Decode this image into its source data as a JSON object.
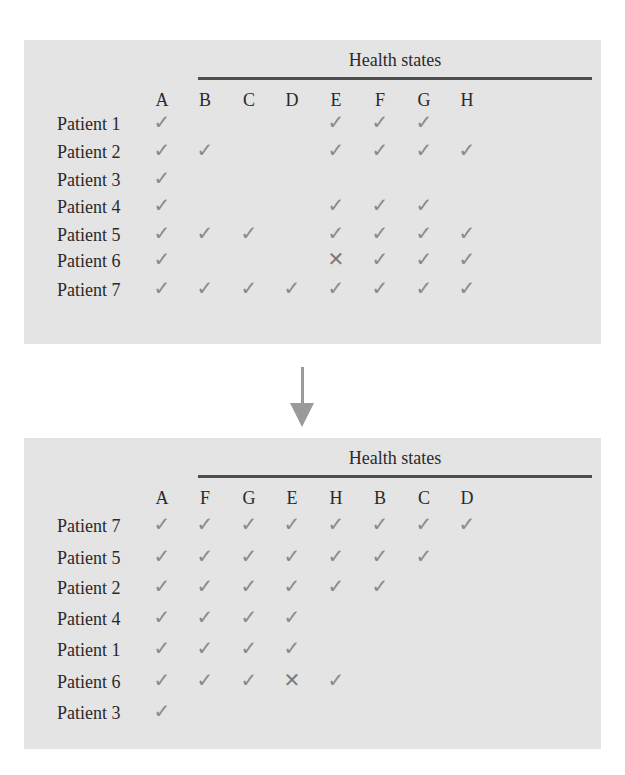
{
  "tables": [
    {
      "title": "Health states",
      "columns": [
        "A",
        "B",
        "C",
        "D",
        "E",
        "F",
        "G",
        "H"
      ],
      "rows": [
        {
          "label": "Patient 1",
          "cells": [
            "check",
            "",
            "",
            "",
            "check",
            "check",
            "check",
            ""
          ]
        },
        {
          "label": "Patient 2",
          "cells": [
            "check",
            "check",
            "",
            "",
            "check",
            "check",
            "check",
            "check"
          ]
        },
        {
          "label": "Patient 3",
          "cells": [
            "check",
            "",
            "",
            "",
            "",
            "",
            "",
            ""
          ]
        },
        {
          "label": "Patient 4",
          "cells": [
            "check",
            "",
            "",
            "",
            "check",
            "check",
            "check",
            ""
          ]
        },
        {
          "label": "Patient 5",
          "cells": [
            "check",
            "check",
            "check",
            "",
            "check",
            "check",
            "check",
            "check"
          ]
        },
        {
          "label": "Patient 6",
          "cells": [
            "check",
            "",
            "",
            "",
            "cross",
            "check",
            "check",
            "check"
          ]
        },
        {
          "label": "Patient 7",
          "cells": [
            "check",
            "check",
            "check",
            "check",
            "check",
            "check",
            "check",
            "check"
          ]
        }
      ]
    },
    {
      "title": "Health states",
      "columns": [
        "A",
        "F",
        "G",
        "E",
        "H",
        "B",
        "C",
        "D"
      ],
      "rows": [
        {
          "label": "Patient 7",
          "cells": [
            "check",
            "check",
            "check",
            "check",
            "check",
            "check",
            "check",
            "check"
          ]
        },
        {
          "label": "Patient 5",
          "cells": [
            "check",
            "check",
            "check",
            "check",
            "check",
            "check",
            "check",
            ""
          ]
        },
        {
          "label": "Patient 2",
          "cells": [
            "check",
            "check",
            "check",
            "check",
            "check",
            "check",
            "",
            ""
          ]
        },
        {
          "label": "Patient 4",
          "cells": [
            "check",
            "check",
            "check",
            "check",
            "",
            "",
            "",
            ""
          ]
        },
        {
          "label": "Patient 1",
          "cells": [
            "check",
            "check",
            "check",
            "check",
            "",
            "",
            "",
            ""
          ]
        },
        {
          "label": "Patient 6",
          "cells": [
            "check",
            "check",
            "check",
            "cross",
            "check",
            "",
            "",
            ""
          ]
        },
        {
          "label": "Patient 3",
          "cells": [
            "check",
            "",
            "",
            "",
            "",
            "",
            "",
            ""
          ]
        }
      ]
    }
  ],
  "symbols": {
    "check": "✓",
    "cross": "✕"
  },
  "colors": {
    "panel_bg": "#e4e4e4",
    "mark": "#8a8a8a",
    "rule": "#4d4d4d",
    "arrow": "#9a9a9a"
  }
}
